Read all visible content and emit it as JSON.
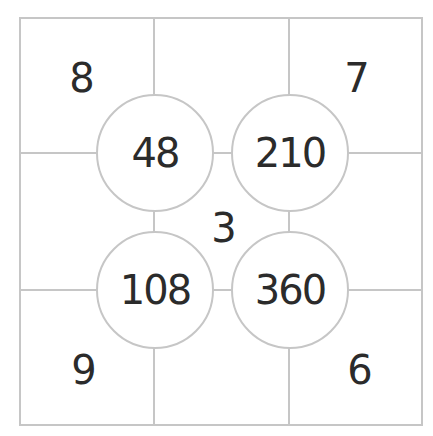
{
  "diagram": {
    "corner_numbers": {
      "top_left": "8",
      "top_right": "7",
      "bottom_left": "9",
      "bottom_right": "6"
    },
    "center_number": "3",
    "circle_products": {
      "top_left": "48",
      "top_right": "210",
      "bottom_left": "108",
      "bottom_right": "360"
    },
    "colors": {
      "line": "#c6c6c6",
      "text": "#2b2b2b"
    }
  }
}
